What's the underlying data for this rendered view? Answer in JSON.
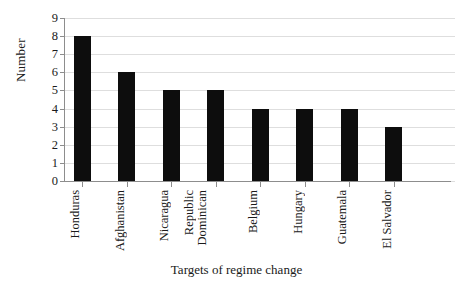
{
  "chart_data": {
    "type": "bar",
    "title": "",
    "xlabel": "Targets of regime change",
    "ylabel": "Number",
    "categories": [
      "Honduras",
      "Afghanistan",
      "Nicaragua",
      "Dominican Republic",
      "Belgium",
      "Hungary",
      "Guatemala",
      "El Salvador"
    ],
    "category_lines": [
      [
        "Honduras"
      ],
      [
        "Afghanistan"
      ],
      [
        "Nicaragua"
      ],
      [
        "Dominican",
        "Republic"
      ],
      [
        "Belgium"
      ],
      [
        "Hungary"
      ],
      [
        "Guatemala"
      ],
      [
        "El Salvador"
      ]
    ],
    "values": [
      8,
      6,
      5,
      5,
      4,
      4,
      4,
      3
    ],
    "ylim": [
      0,
      9
    ],
    "yticks": [
      0,
      1,
      2,
      3,
      4,
      5,
      6,
      7,
      8,
      9
    ],
    "ytick_labels": [
      "0",
      "1",
      "2",
      "3",
      "4",
      "5",
      "6",
      "7",
      "8",
      "9"
    ],
    "grid": true,
    "grid_color": "#dedede",
    "bar_color": "#0d0d0d",
    "axis_color": "#8d8d8d",
    "legend": null
  }
}
